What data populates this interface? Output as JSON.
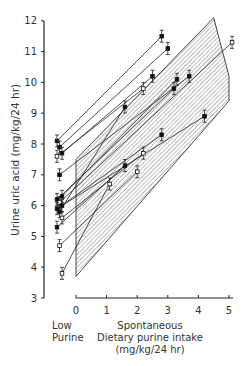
{
  "chart_data": {
    "type": "line",
    "title": "",
    "ylabel": "Urine uric acid (mg/kg/24 hr)",
    "xlabel": "Spontaneous Dietary purine intake (mg/kg/24 hr)",
    "x_low_label_line1": "Low",
    "x_low_label_line2": "Purine",
    "x_label_line1": "Spontaneous",
    "x_label_line2": "Dietary purine intake",
    "x_label_line3": "(mg/kg/24 hr)",
    "ylim": [
      3,
      12
    ],
    "xlim": [
      0,
      5
    ],
    "yticks": [
      "3",
      "4",
      "5",
      "6",
      "7",
      "8",
      "9",
      "10",
      "11",
      "12"
    ],
    "xticks": [
      "0",
      "1",
      "2",
      "3",
      "4",
      "5"
    ],
    "grid": false,
    "band": {
      "description": "hatched normal range band",
      "lower": [
        [
          0,
          3.7
        ],
        [
          5,
          9.4
        ]
      ],
      "upper": [
        [
          0,
          7.5
        ],
        [
          4.5,
          12.1
        ]
      ]
    },
    "series": [
      {
        "name": "subject 1",
        "low": 8.1,
        "x": 2.8,
        "y": 11.5
      },
      {
        "name": "subject 2",
        "low": 7.9,
        "x": 3.0,
        "y": 11.1
      },
      {
        "name": "subject 3",
        "low": 7.7,
        "x": 2.5,
        "y": 10.2
      },
      {
        "name": "subject 4",
        "low": 7.6,
        "x": 2.2,
        "y": 9.8
      },
      {
        "name": "subject 5",
        "low": 7.0,
        "x": 3.7,
        "y": 10.2
      },
      {
        "name": "subject 6",
        "low": 6.3,
        "x": 3.3,
        "y": 10.1
      },
      {
        "name": "subject 7",
        "low": 6.2,
        "x": 3.2,
        "y": 9.8
      },
      {
        "name": "subject 8",
        "low": 6.1,
        "x": 5.1,
        "y": 11.3
      },
      {
        "name": "subject 9",
        "low": 6.0,
        "x": 4.2,
        "y": 8.9
      },
      {
        "name": "subject 10",
        "low": 5.9,
        "x": 2.8,
        "y": 8.3
      },
      {
        "name": "subject 11",
        "low": 5.8,
        "x": 1.6,
        "y": 9.2
      },
      {
        "name": "subject 12",
        "low": 5.6,
        "x": 2.2,
        "y": 7.7
      },
      {
        "name": "subject 13",
        "low": 5.3,
        "x": 1.6,
        "y": 7.3
      },
      {
        "name": "subject 14",
        "low": 4.7,
        "x": 2.0,
        "y": 7.1
      },
      {
        "name": "subject 15",
        "low": 3.8,
        "x": 1.1,
        "y": 6.7
      }
    ]
  }
}
